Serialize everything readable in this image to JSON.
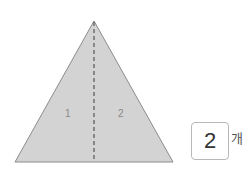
{
  "figure": {
    "shape": "triangle",
    "fill_color": "#d3d3d3",
    "stroke_color": "#8c8c8c",
    "divider_style": "dashed",
    "part_labels": [
      "1",
      "2"
    ]
  },
  "answer": {
    "value": "2",
    "unit": "개"
  }
}
